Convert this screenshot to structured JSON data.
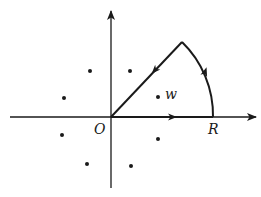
{
  "diagram": {
    "labels": {
      "origin": "O",
      "radius": "R",
      "point": "w"
    },
    "colors": {
      "stroke": "#1a1a1a",
      "background": "#ffffff"
    },
    "axes": {
      "origin_px": [
        111,
        117
      ],
      "x_axis": {
        "from": [
          10,
          117
        ],
        "to": [
          257,
          117
        ]
      },
      "y_axis": {
        "from": [
          111,
          188
        ],
        "to": [
          111,
          10
        ]
      }
    },
    "contour": {
      "radius_px": 102,
      "angle_deg": 45,
      "apex_px": [
        182,
        42
      ],
      "segments": [
        "segment O to R along real axis",
        "arc R to apex counterclockwise",
        "segment apex back to O"
      ]
    },
    "points": [
      {
        "x": 90,
        "y": 71
      },
      {
        "x": 130,
        "y": 71
      },
      {
        "x": 64,
        "y": 98
      },
      {
        "x": 158,
        "y": 97,
        "label": "w"
      },
      {
        "x": 62,
        "y": 135
      },
      {
        "x": 158,
        "y": 139
      },
      {
        "x": 87,
        "y": 164
      },
      {
        "x": 131,
        "y": 166
      }
    ]
  }
}
